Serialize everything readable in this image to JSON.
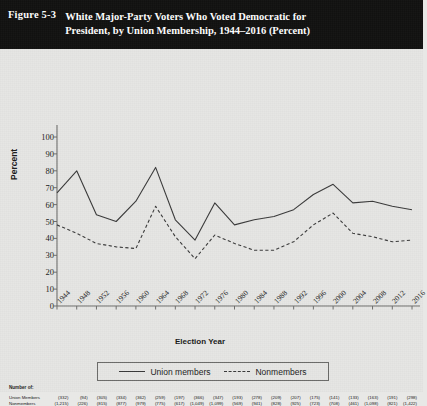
{
  "header": {
    "figure_number": "Figure 5-3",
    "title_line1": "White Major-Party Voters Who Voted Democratic for",
    "title_line2": "President, by Union Membership, 1944–2016 (Percent)",
    "background_color": "#111110",
    "text_color": "#ffffff"
  },
  "legend": {
    "items": [
      {
        "label": "Union members",
        "style": "solid"
      },
      {
        "label": "Nonmembers",
        "style": "dashed"
      }
    ]
  },
  "footnote": {
    "title": "Number of:",
    "rows": [
      {
        "label": "Union Members",
        "values": [
          "(332)",
          "(94)",
          "(305)",
          "(334)",
          "(362)",
          "(259)",
          "(197)",
          "(366)",
          "(347)",
          "(193)",
          "(278)",
          "(209)",
          "(207)",
          "(175)",
          "(141)",
          "(133)",
          "(163)",
          "(191)",
          "(298)"
        ]
      },
      {
        "label": "Nonmembers",
        "values": [
          "(1,215)",
          "(226)",
          "(815)",
          "(877)",
          "(979)",
          "(775)",
          "(617)",
          "(1,049)",
          "(1,099)",
          "(569)",
          "(941)",
          "(828)",
          "(925)",
          "(723)",
          "(708)",
          "(461)",
          "(1,098)",
          "(821)",
          "(1,422)"
        ]
      }
    ]
  },
  "chart_data": {
    "type": "line",
    "title": "White Major-Party Voters Who Voted Democratic for President, by Union Membership, 1944–2016 (Percent)",
    "xlabel": "Election Year",
    "ylabel": "Percent",
    "ylim": [
      0,
      100
    ],
    "ytick_step": 10,
    "yticks": [
      100,
      90,
      80,
      70,
      60,
      50,
      40,
      30,
      20,
      10,
      0
    ],
    "grid": false,
    "legend_position": "bottom",
    "categories": [
      "1944",
      "1948",
      "1952",
      "1956",
      "1960",
      "1964",
      "1968",
      "1972",
      "1976",
      "1980",
      "1984",
      "1988",
      "1992",
      "1996",
      "2000",
      "2004",
      "2008",
      "2012",
      "2016"
    ],
    "series": [
      {
        "name": "Union members",
        "style": "solid",
        "color": "#3a3a3a",
        "values": [
          67,
          80,
          54,
          50,
          62,
          82,
          51,
          39,
          61,
          48,
          51,
          53,
          57,
          66,
          72,
          61,
          62,
          59,
          57
        ]
      },
      {
        "name": "Nonmembers",
        "style": "dashed",
        "color": "#3a3a3a",
        "values": [
          48,
          43,
          37,
          35,
          34,
          59,
          41,
          28,
          42,
          37,
          33,
          33,
          38,
          48,
          55,
          43,
          41,
          38,
          39
        ]
      }
    ]
  }
}
